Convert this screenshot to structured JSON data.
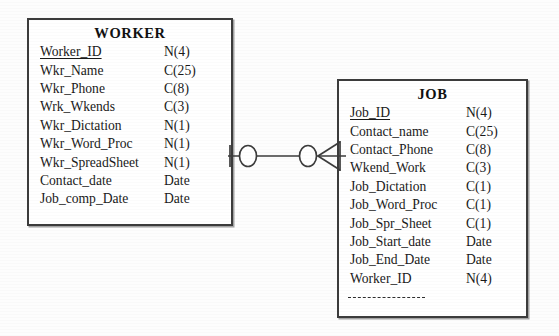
{
  "diagram": {
    "type": "entity-relationship-diagram",
    "notation": "crow's foot",
    "background_color": "#fdfdfd",
    "line_color": "#3c3c3c"
  },
  "entities": [
    {
      "name": "WORKER",
      "attributes": [
        {
          "name": "Worker_ID",
          "type": "N(4)",
          "key": "primary"
        },
        {
          "name": "Wkr_Name",
          "type": "C(25)",
          "key": ""
        },
        {
          "name": "Wkr_Phone",
          "type": "C(8)",
          "key": ""
        },
        {
          "name": "Wrk_Wkends",
          "type": "C(3)",
          "key": ""
        },
        {
          "name": "Wkr_Dictation",
          "type": "N(1)",
          "key": ""
        },
        {
          "name": "Wkr_Word_Proc",
          "type": "N(1)",
          "key": ""
        },
        {
          "name": "Wkr_SpreadSheet",
          "type": "N(1)",
          "key": ""
        },
        {
          "name": "Contact_date",
          "type": "Date",
          "key": ""
        },
        {
          "name": "Job_comp_Date",
          "type": "Date",
          "key": ""
        }
      ]
    },
    {
      "name": "JOB",
      "attributes": [
        {
          "name": "Job_ID",
          "type": "N(4)",
          "key": "primary"
        },
        {
          "name": "Contact_name",
          "type": "C(25)",
          "key": ""
        },
        {
          "name": "Contact_Phone",
          "type": "C(8)",
          "key": ""
        },
        {
          "name": "Wkend_Work",
          "type": "C(3)",
          "key": ""
        },
        {
          "name": "Job_Dictation",
          "type": "C(1)",
          "key": ""
        },
        {
          "name": "Job_Word_Proc",
          "type": "C(1)",
          "key": ""
        },
        {
          "name": "Job_Spr_Sheet",
          "type": "C(1)",
          "key": ""
        },
        {
          "name": "Job_Start_date",
          "type": "Date",
          "key": ""
        },
        {
          "name": "Job_End_Date",
          "type": "Date",
          "key": ""
        },
        {
          "name": "Worker_ID",
          "type": "N(4)",
          "key": "foreign"
        }
      ]
    }
  ],
  "relationship": {
    "from_entity": "WORKER",
    "to_entity": "JOB",
    "from_cardinality": "zero-or-one",
    "to_cardinality": "zero-or-many",
    "from_symbol": "circle-and-bar",
    "to_symbol": "circle-and-crowsfoot"
  }
}
